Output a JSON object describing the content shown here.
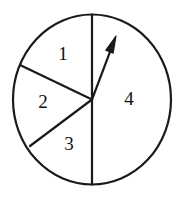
{
  "figure": {
    "type": "spinner-diagram",
    "title": "",
    "background_color": "#ffffff",
    "stroke_color": "#1a1a1a",
    "label_color": "#111111"
  },
  "circle": {
    "center_x": 92,
    "center_y": 99.5,
    "radius_x": 79,
    "radius_y": 85,
    "stroke_width": 2.2
  },
  "sectors": [
    {
      "label": "1",
      "label_x": 63,
      "label_y": 56,
      "start_angle_deg": 0,
      "end_angle_deg": 65,
      "sweep_deg": 65
    },
    {
      "label": "2",
      "label_x": 43,
      "label_y": 104,
      "start_angle_deg": 65,
      "end_angle_deg": 149,
      "sweep_deg": 84
    },
    {
      "label": "3",
      "label_x": 69,
      "label_y": 146,
      "start_angle_deg": 149,
      "end_angle_deg": 180,
      "sweep_deg": 31
    },
    {
      "label": "4",
      "label_x": 129,
      "label_y": 101,
      "start_angle_deg": 180,
      "end_angle_deg": 360,
      "sweep_deg": 180
    }
  ],
  "radii": [
    {
      "name": "radius-top",
      "x1": 92,
      "y1": 99.5,
      "x2": 92,
      "y2": 14.5
    },
    {
      "name": "radius-upper-left",
      "x1": 92,
      "y1": 99.5,
      "x2": 20,
      "y2": 65
    },
    {
      "name": "radius-lower-left",
      "x1": 92,
      "y1": 99.5,
      "x2": 30,
      "y2": 146
    },
    {
      "name": "radius-bottom",
      "x1": 92,
      "y1": 99.5,
      "x2": 92,
      "y2": 184.5
    }
  ],
  "pointer": {
    "name": "spinner-arrow",
    "tail_x": 92,
    "tail_y": 99.5,
    "tip_x": 116,
    "tip_y": 36,
    "angle_from_top_deg": 21,
    "points_to_sector": "4",
    "stroke_width": 2.2,
    "head_length": 17,
    "head_width": 9
  }
}
